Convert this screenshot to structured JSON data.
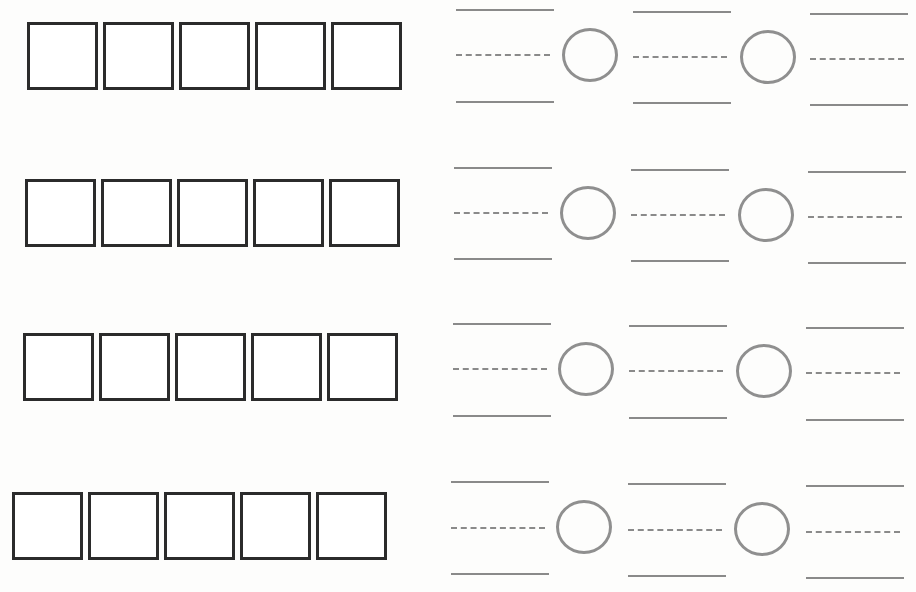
{
  "worksheet": {
    "rows": [
      {
        "boxes": 5,
        "fractions": 3,
        "comparison_circles": 2
      },
      {
        "boxes": 5,
        "fractions": 3,
        "comparison_circles": 2
      },
      {
        "boxes": 5,
        "fractions": 3,
        "comparison_circles": 2
      },
      {
        "boxes": 5,
        "fractions": 3,
        "comparison_circles": 2
      }
    ],
    "colors": {
      "box_border": "#2b2b2b",
      "line": "#8a8a8a",
      "circle": "#8f8f8f",
      "background": "#fdfdfc"
    }
  }
}
